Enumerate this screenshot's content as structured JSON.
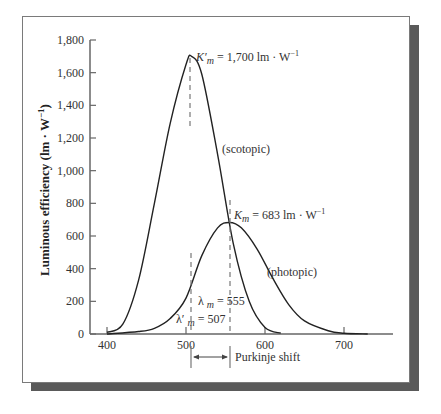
{
  "chart_data": {
    "type": "line",
    "title": "",
    "xlabel": "",
    "ylabel": "Luminous efficiency (lm · W⁻¹)",
    "xlim": [
      380,
      730
    ],
    "ylim": [
      0,
      1800
    ],
    "x_ticks": [
      "400",
      "500",
      "600",
      "700"
    ],
    "y_ticks": [
      "0",
      "200",
      "400",
      "600",
      "800",
      "1,000",
      "1,200",
      "1,400",
      "1,600",
      "1,800"
    ],
    "grid": false,
    "legend": "none (inline labels)",
    "series": [
      {
        "name": "scotopic",
        "label": "(scotopic)",
        "peak_wavelength": 507,
        "peak_value": 1700,
        "x": [
          400,
          420,
          440,
          460,
          480,
          500,
          507,
          520,
          540,
          560,
          580,
          600,
          620
        ],
        "values": [
          10,
          60,
          330,
          800,
          1290,
          1650,
          1700,
          1590,
          1100,
          550,
          200,
          40,
          5
        ]
      },
      {
        "name": "photopic",
        "label": "(photopic)",
        "peak_wavelength": 555,
        "peak_value": 683,
        "x": [
          400,
          440,
          460,
          480,
          500,
          520,
          540,
          555,
          570,
          590,
          610,
          630,
          650,
          680,
          700,
          730
        ],
        "values": [
          0,
          15,
          35,
          95,
          220,
          480,
          650,
          683,
          650,
          520,
          340,
          180,
          80,
          20,
          5,
          0
        ]
      }
    ],
    "annotations": {
      "scotopic_peak": "K′ₘ = 1,700 lm · W⁻¹",
      "photopic_peak": "Kₘ = 683 lm · W⁻¹",
      "lambda_photopic": "λ ₘ = 555",
      "lambda_scotopic": "λ′ ₘ = 507",
      "shift": "Purkinje shift"
    }
  },
  "labels": {
    "ylabel": "Luminous efficiency (lm · W",
    "ylabel_sup": "−1",
    "ylabel_end": ")",
    "scotopic": "(scotopic)",
    "photopic": "(photopic)",
    "kprime_k": "K",
    "kprime_prime": "′",
    "kprime_sub": "m",
    "kprime_rest": " = 1,700 lm · W",
    "kprime_sup": "−1",
    "k_k": "K",
    "k_sub": "m",
    "k_rest": " = 683 lm · W",
    "k_sup": "−1",
    "lam_l": "λ",
    "lam_sub": "m",
    "lam_rest": " = 555",
    "lamp_l": "λ′",
    "lamp_sub": "m",
    "lamp_rest": " = 507",
    "purkinje": "Purkinje shift"
  },
  "colors": {
    "curve": "#222222",
    "axis": "#666666",
    "shadow": "#5a5a5a"
  }
}
